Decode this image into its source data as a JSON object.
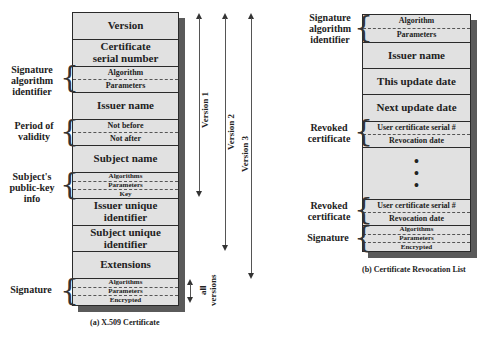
{
  "x509": {
    "caption": "(a) X.509 Certificate",
    "rows": {
      "version": "Version",
      "serial_1": "Certificate",
      "serial_2": "serial number",
      "sigalg_algorithm": "Algorithm",
      "sigalg_parameters": "Parameters",
      "issuer_name": "Issuer name",
      "not_before": "Not before",
      "not_after": "Not after",
      "subject_name": "Subject name",
      "pk_algorithms": "Algorithms",
      "pk_parameters": "Parameters",
      "pk_key": "Key",
      "issuer_uid_1": "Issuer unique",
      "issuer_uid_2": "identifier",
      "subject_uid_1": "Subject unique",
      "subject_uid_2": "identifier",
      "extensions": "Extensions",
      "sig_algorithms": "Algorithms",
      "sig_parameters": "Parameters",
      "sig_encrypted": "Encrypted"
    },
    "labels": {
      "sigalg_1": "Signature",
      "sigalg_2": "algorithm",
      "sigalg_3": "identifier",
      "validity_1": "Period of",
      "validity_2": "validity",
      "pk_1": "Subject's",
      "pk_2": "public-key",
      "pk_3": "info",
      "signature": "Signature"
    },
    "versions": {
      "v1": "Version 1",
      "v2": "Version 2",
      "v3": "Version 3",
      "all_1": "all",
      "all_2": "versions"
    }
  },
  "crl": {
    "caption": "(b) Certificate Revocation List",
    "rows": {
      "sigalg_algorithm": "Algorithm",
      "sigalg_parameters": "Parameters",
      "issuer_name": "Issuer name",
      "this_update": "This update date",
      "next_update": "Next update date",
      "user_serial_1": "User certificate serial #",
      "revocation_date_1": "Revocation date",
      "ellipsis": "•",
      "user_serial_2": "User certificate serial #",
      "revocation_date_2": "Revocation date",
      "sig_algorithms": "Algorithms",
      "sig_parameters": "Parameters",
      "sig_encrypted": "Encrypted"
    },
    "labels": {
      "sigalg_1": "Signature",
      "sigalg_2": "algorithm",
      "sigalg_3": "identifier",
      "revoked1_1": "Revoked",
      "revoked1_2": "certificate",
      "revoked2_1": "Revoked",
      "revoked2_2": "certificate",
      "signature": "Signature"
    }
  },
  "colors": {
    "box_fill": "#e1e1e1",
    "border": "#2a2a2a",
    "shadow": "#5a5a5a"
  }
}
